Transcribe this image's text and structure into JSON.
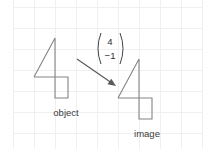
{
  "diagram": {
    "type": "translation-diagram",
    "background_color": "#ffffff",
    "grid": {
      "visible": true,
      "color": "#eef0f2",
      "cell_size": 21,
      "origin_x": 13,
      "origin_y": 7,
      "columns": 9,
      "rows": 7
    },
    "stroke_color": "#848484",
    "arrow_color": "#5a5a5a",
    "text_color": "#3a3a3a"
  },
  "object_shape": {
    "label": "object",
    "label_x": 66,
    "label_y": 116,
    "points": "55,38 55,98 68,98 68,77 34,77 55,38",
    "outline_points": "34,77 55,38 55,98 68,98 68,77 34,77"
  },
  "image_shape": {
    "label": "image",
    "label_x": 147,
    "label_y": 137,
    "outline_points": "118,98 139,59 139,119 152,119 152,98 118,98"
  },
  "translation_vector": {
    "x_component": "4",
    "y_component": "−1",
    "left_paren_x": 96,
    "right_paren_x": 125,
    "numbers_center_x": 110,
    "top_number_y": 45,
    "bottom_number_y": 59
  },
  "arrow": {
    "name": "translation-arrow",
    "start_x": 77,
    "start_y": 59,
    "end_x": 116,
    "end_y": 86
  }
}
